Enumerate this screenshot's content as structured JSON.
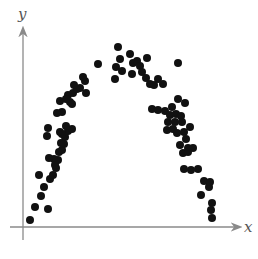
{
  "chart_data": {
    "type": "scatter",
    "title": "",
    "xlabel": "x",
    "ylabel": "y",
    "grid": false,
    "legend": null,
    "ticks": false,
    "axis_color": "#8a8a8a",
    "point_color": "#111111",
    "pixel_frame": {
      "origin_x": 23,
      "origin_y": 227,
      "x_axis_end": 240,
      "y_axis_top": 26
    },
    "points_px": [
      [
        30,
        220
      ],
      [
        35,
        207
      ],
      [
        41,
        196
      ],
      [
        48,
        209
      ],
      [
        44,
        187
      ],
      [
        50,
        179
      ],
      [
        39,
        175
      ],
      [
        53,
        175
      ],
      [
        56,
        168
      ],
      [
        58,
        160
      ],
      [
        54,
        159
      ],
      [
        59,
        152
      ],
      [
        62,
        150
      ],
      [
        61,
        143
      ],
      [
        49,
        158
      ],
      [
        55,
        165
      ],
      [
        64,
        144
      ],
      [
        65,
        137
      ],
      [
        60,
        132
      ],
      [
        47,
        136
      ],
      [
        68,
        131
      ],
      [
        72,
        129
      ],
      [
        48,
        128
      ],
      [
        62,
        134
      ],
      [
        66,
        126
      ],
      [
        62,
        112
      ],
      [
        57,
        113
      ],
      [
        60,
        101
      ],
      [
        68,
        95
      ],
      [
        73,
        93
      ],
      [
        70,
        102
      ],
      [
        80,
        88
      ],
      [
        85,
        81
      ],
      [
        77,
        89
      ],
      [
        66,
        99
      ],
      [
        83,
        77
      ],
      [
        74,
        85
      ],
      [
        72,
        104
      ],
      [
        86,
        93
      ],
      [
        98,
        64
      ],
      [
        118,
        47
      ],
      [
        120,
        59
      ],
      [
        116,
        67
      ],
      [
        115,
        79
      ],
      [
        122,
        71
      ],
      [
        130,
        54
      ],
      [
        133,
        63
      ],
      [
        137,
        61
      ],
      [
        140,
        66
      ],
      [
        132,
        74
      ],
      [
        142,
        72
      ],
      [
        147,
        58
      ],
      [
        146,
        78
      ],
      [
        150,
        84
      ],
      [
        158,
        79
      ],
      [
        163,
        84
      ],
      [
        154,
        85
      ],
      [
        178,
        63
      ],
      [
        152,
        109
      ],
      [
        158,
        110
      ],
      [
        165,
        111
      ],
      [
        178,
        99
      ],
      [
        172,
        107
      ],
      [
        170,
        115
      ],
      [
        176,
        114
      ],
      [
        181,
        116
      ],
      [
        185,
        103
      ],
      [
        182,
        122
      ],
      [
        173,
        129
      ],
      [
        167,
        130
      ],
      [
        177,
        133
      ],
      [
        184,
        132
      ],
      [
        190,
        127
      ],
      [
        186,
        139
      ],
      [
        180,
        145
      ],
      [
        188,
        148
      ],
      [
        193,
        148
      ],
      [
        183,
        153
      ],
      [
        191,
        170
      ],
      [
        184,
        169
      ],
      [
        198,
        169
      ],
      [
        204,
        181
      ],
      [
        209,
        187
      ],
      [
        210,
        182
      ],
      [
        201,
        195
      ],
      [
        212,
        203
      ],
      [
        211,
        210
      ],
      [
        212,
        218
      ],
      [
        188,
        152
      ],
      [
        168,
        122
      ],
      [
        175,
        122
      ]
    ]
  }
}
